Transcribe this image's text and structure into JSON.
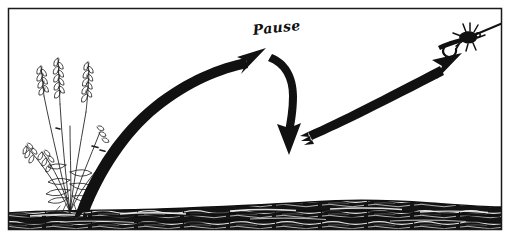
{
  "figure": {
    "caption_label": "Pause",
    "background_color": "#ffffff",
    "ink_color": "#111111",
    "frame": {
      "name": "panel-border",
      "color": "#1a1a1a",
      "x": 8,
      "y": 8,
      "width": 494,
      "height": 222,
      "stroke_width": 1.5
    },
    "elements": [
      {
        "name": "grass-plant",
        "kind": "line-art-plant",
        "description": "Tall seed-head grass clump in pen and ink at lower left",
        "color": "#1a1a1a"
      },
      {
        "name": "water-band",
        "kind": "textured-band",
        "description": "Dark horizontal water surface with wavy highlight streaks along the bottom",
        "color": "#141414"
      },
      {
        "name": "arrow-forward-cast",
        "kind": "curved-arrow",
        "description": "Thick tapered arrow sweeping up from the water at the left to a high point at center",
        "direction": "up-right",
        "color": "#111111"
      },
      {
        "name": "arrow-pause-drop",
        "kind": "curved-arrow",
        "description": "Arrow curving downward from the high point, marking the pause in the stroke",
        "direction": "down",
        "color": "#111111"
      },
      {
        "name": "arrow-delivery",
        "kind": "straight-arrow",
        "description": "Straight tapered arrow rising to the right toward the fly",
        "direction": "up-right",
        "color": "#111111"
      },
      {
        "name": "fishing-fly-icon",
        "kind": "lure",
        "description": "Hackled artificial fly tied to the leader at the upper right, line exiting the frame",
        "color": "#111111"
      }
    ]
  }
}
